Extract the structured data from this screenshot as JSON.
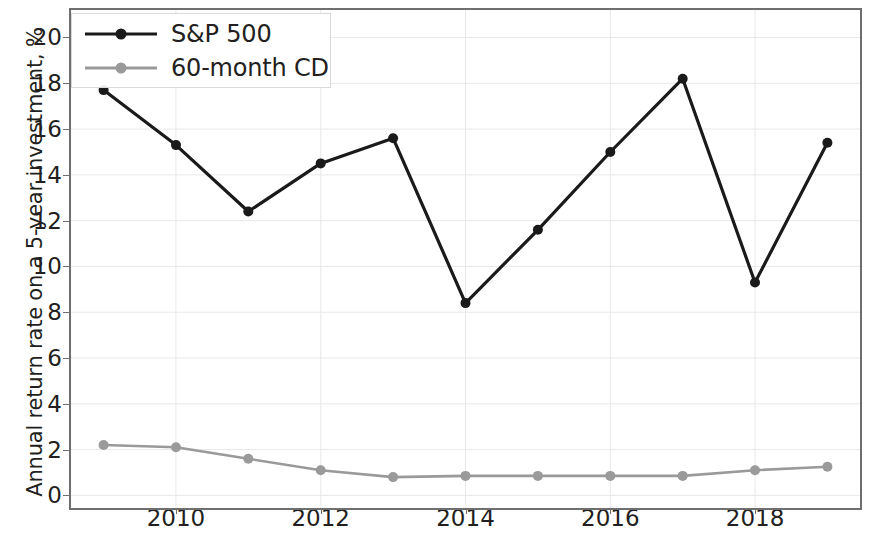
{
  "chart_data": {
    "type": "line",
    "title": "",
    "xlabel": "",
    "ylabel": "Annual return rate on a 5-year investment, %",
    "x": [
      2009,
      2010,
      2011,
      2012,
      2013,
      2014,
      2015,
      2016,
      2017,
      2018,
      2019
    ],
    "xlim": [
      2008.55,
      2019.45
    ],
    "ylim": [
      -0.55,
      21.2
    ],
    "xticks": [
      2010,
      2012,
      2014,
      2016,
      2018
    ],
    "yticks": [
      0,
      2,
      4,
      6,
      8,
      10,
      12,
      14,
      16,
      18,
      20
    ],
    "grid": true,
    "grid_color": "#e8e8e8",
    "legend_position": "upper-left",
    "series": [
      {
        "name": "S&P 500",
        "color": "#1a1a1a",
        "marker": "o",
        "values": [
          17.7,
          15.3,
          12.4,
          14.5,
          15.6,
          8.4,
          11.6,
          15.0,
          18.2,
          9.3,
          15.4
        ]
      },
      {
        "name": "60-month CD",
        "color": "#9a9a9a",
        "marker": "o",
        "values": [
          2.2,
          2.1,
          1.6,
          1.1,
          0.8,
          0.85,
          0.85,
          0.85,
          0.85,
          1.1,
          1.25
        ]
      }
    ]
  },
  "axes": {
    "y_tick_labels": [
      "0",
      "2",
      "4",
      "6",
      "8",
      "10",
      "12",
      "14",
      "16",
      "18",
      "20"
    ],
    "x_tick_labels": [
      "2010",
      "2012",
      "2014",
      "2016",
      "2018"
    ],
    "y_axis_title": "Annual return rate on a 5-year investment, %"
  },
  "legend": {
    "items": [
      {
        "label": "S&P 500"
      },
      {
        "label": "60-month CD"
      }
    ]
  },
  "colors": {
    "sp500": "#1a1a1a",
    "cd": "#9a9a9a",
    "axis": "#6f6f6f",
    "grid": "#e8e8e8",
    "text": "#231f20"
  }
}
